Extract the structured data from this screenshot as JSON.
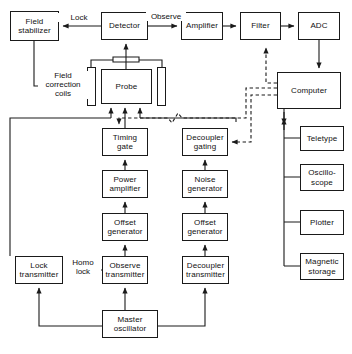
{
  "diagram": {
    "stroke_color": "#1a1a1a",
    "background": "#ffffff",
    "nodes": [
      {
        "id": "field-stabilizer",
        "label": "Field\nstabilizer",
        "x": 10,
        "y": 11,
        "w": 49,
        "h": 30
      },
      {
        "id": "detector",
        "label": "Detector",
        "x": 101,
        "y": 12,
        "w": 47,
        "h": 28
      },
      {
        "id": "amplifier",
        "label": "Amplifier",
        "x": 181,
        "y": 12,
        "w": 42,
        "h": 28
      },
      {
        "id": "filter",
        "label": "Filter",
        "x": 240,
        "y": 12,
        "w": 41,
        "h": 28
      },
      {
        "id": "adc",
        "label": "ADC",
        "x": 298,
        "y": 12,
        "w": 42,
        "h": 28
      },
      {
        "id": "probe",
        "label": "Probe",
        "x": 101,
        "y": 69,
        "w": 51,
        "h": 35
      },
      {
        "id": "computer",
        "label": "Computer",
        "x": 277,
        "y": 72,
        "w": 64,
        "h": 37
      },
      {
        "id": "timing-gate",
        "label": "Timing\ngate",
        "x": 102,
        "y": 128,
        "w": 46,
        "h": 28
      },
      {
        "id": "decoupler-gating",
        "label": "Decoupler\ngating",
        "x": 182,
        "y": 128,
        "w": 46,
        "h": 28
      },
      {
        "id": "teletype",
        "label": "Teletype",
        "x": 300,
        "y": 126,
        "w": 44,
        "h": 25
      },
      {
        "id": "power-amplifier",
        "label": "Power\namplifier",
        "x": 102,
        "y": 170,
        "w": 46,
        "h": 28
      },
      {
        "id": "noise-generator",
        "label": "Noise\ngenerator",
        "x": 182,
        "y": 170,
        "w": 46,
        "h": 28
      },
      {
        "id": "oscilloscope",
        "label": "Oscillo-\nscope",
        "x": 300,
        "y": 164,
        "w": 44,
        "h": 27
      },
      {
        "id": "offset-generator-1",
        "label": "Offset\ngenerator",
        "x": 102,
        "y": 213,
        "w": 46,
        "h": 28
      },
      {
        "id": "offset-generator-2",
        "label": "Offset\ngenerator",
        "x": 182,
        "y": 213,
        "w": 46,
        "h": 28
      },
      {
        "id": "plotter",
        "label": "Plotter",
        "x": 300,
        "y": 210,
        "w": 44,
        "h": 25
      },
      {
        "id": "lock-transmitter",
        "label": "Lock\ntransmitter",
        "x": 15,
        "y": 256,
        "w": 48,
        "h": 28
      },
      {
        "id": "observe-transmitter",
        "label": "Observe\ntransmitter",
        "x": 102,
        "y": 256,
        "w": 46,
        "h": 28
      },
      {
        "id": "decoupler-transmitter",
        "label": "Decoupler\ntransmitter",
        "x": 182,
        "y": 256,
        "w": 47,
        "h": 28
      },
      {
        "id": "magnetic-storage",
        "label": "Magnetic\nstorage",
        "x": 300,
        "y": 253,
        "w": 44,
        "h": 27
      },
      {
        "id": "master-oscillator",
        "label": "Master\noscillator",
        "x": 102,
        "y": 310,
        "w": 56,
        "h": 28
      }
    ],
    "coils": [
      {
        "id": "field-correction-coil-left",
        "x": 87,
        "y": 67,
        "w": 9,
        "h": 39
      },
      {
        "id": "field-correction-coil-right",
        "x": 157,
        "y": 67,
        "w": 9,
        "h": 39
      }
    ],
    "edge_labels": [
      {
        "id": "lock-label",
        "text": "Lock",
        "x": 58,
        "y": 13,
        "w": 40
      },
      {
        "id": "observe-label",
        "text": "Observe",
        "x": 146,
        "y": 12,
        "w": 38
      },
      {
        "id": "field-correction-coils-label",
        "text": "Field\ncorrection\ncoils",
        "x": 38,
        "y": 71,
        "w": 48
      },
      {
        "id": "homo-lock-label",
        "text": "Homo\nlock",
        "x": 65,
        "y": 258,
        "w": 34
      }
    ]
  }
}
